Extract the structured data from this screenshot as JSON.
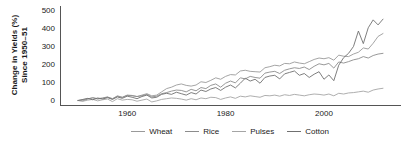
{
  "chart_data": {
    "type": "line",
    "title": "",
    "xlabel": "",
    "ylabel": "Change in Yields (%) Since 1950–51",
    "ylabel_line1": "Change in Yields (%)",
    "ylabel_line2": "Since 1950–51",
    "xlim": [
      1950,
      2012
    ],
    "ylim": [
      -30,
      520
    ],
    "yticks": [
      0,
      100,
      200,
      300,
      400,
      500
    ],
    "ytick_labels": [
      "0",
      "100",
      "200",
      "300",
      "400",
      "500"
    ],
    "xticks": [
      1960,
      1980,
      2000
    ],
    "xtick_labels": [
      "1960",
      "1980",
      "2000"
    ],
    "grid": false,
    "legend_position": "below",
    "axis_color": "#555555",
    "x": [
      1950,
      1951,
      1952,
      1953,
      1954,
      1955,
      1956,
      1957,
      1958,
      1959,
      1960,
      1961,
      1962,
      1963,
      1964,
      1965,
      1966,
      1967,
      1968,
      1969,
      1970,
      1971,
      1972,
      1973,
      1974,
      1975,
      1976,
      1977,
      1978,
      1979,
      1980,
      1981,
      1982,
      1983,
      1984,
      1985,
      1986,
      1987,
      1988,
      1989,
      1990,
      1991,
      1992,
      1993,
      1994,
      1995,
      1996,
      1997,
      1998,
      1999,
      2000,
      2001,
      2002,
      2003,
      2004,
      2005,
      2006,
      2007,
      2008,
      2009,
      2010,
      2011,
      2012
    ],
    "series": [
      {
        "name": "Wheat",
        "color": "#9a9a9a",
        "values": [
          0,
          4,
          10,
          14,
          8,
          12,
          18,
          11,
          22,
          17,
          28,
          26,
          22,
          30,
          38,
          26,
          30,
          48,
          66,
          74,
          86,
          92,
          84,
          80,
          86,
          104,
          100,
          112,
          126,
          118,
          134,
          144,
          142,
          164,
          168,
          162,
          160,
          158,
          182,
          188,
          196,
          192,
          206,
          204,
          214,
          208,
          204,
          216,
          228,
          236,
          232,
          238,
          224,
          252,
          246,
          244,
          258,
          268,
          292,
          286,
          318,
          356,
          372
        ]
      },
      {
        "name": "Rice",
        "color": "#8c8c8c",
        "values": [
          0,
          -2,
          8,
          16,
          10,
          14,
          20,
          8,
          26,
          18,
          30,
          28,
          22,
          26,
          34,
          20,
          24,
          38,
          44,
          52,
          58,
          56,
          48,
          62,
          54,
          72,
          66,
          84,
          92,
          74,
          96,
          108,
          98,
          126,
          120,
          134,
          128,
          124,
          152,
          158,
          162,
          150,
          168,
          176,
          182,
          178,
          186,
          172,
          190,
          204,
          198,
          206,
          180,
          214,
          208,
          216,
          226,
          232,
          244,
          236,
          250,
          258,
          262
        ]
      },
      {
        "name": "Pulses",
        "color": "#a5a5a5",
        "values": [
          0,
          -4,
          2,
          6,
          -2,
          4,
          8,
          -6,
          10,
          2,
          6,
          4,
          -4,
          2,
          8,
          -8,
          -2,
          6,
          10,
          14,
          12,
          8,
          2,
          10,
          4,
          14,
          10,
          18,
          16,
          6,
          14,
          20,
          12,
          24,
          20,
          26,
          22,
          18,
          28,
          26,
          30,
          24,
          32,
          28,
          34,
          30,
          26,
          32,
          36,
          34,
          30,
          36,
          26,
          40,
          36,
          42,
          44,
          48,
          52,
          46,
          58,
          64,
          68
        ]
      },
      {
        "name": "Cotton",
        "color": "#707070",
        "values": [
          0,
          6,
          12,
          4,
          14,
          8,
          16,
          6,
          20,
          12,
          24,
          18,
          10,
          22,
          30,
          14,
          18,
          34,
          40,
          34,
          46,
          38,
          30,
          44,
          36,
          58,
          50,
          64,
          72,
          56,
          74,
          86,
          70,
          96,
          124,
          108,
          118,
          96,
          128,
          136,
          140,
          120,
          148,
          156,
          164,
          140,
          150,
          128,
          146,
          160,
          118,
          142,
          110,
          196,
          238,
          262,
          300,
          386,
          316,
          404,
          448,
          420,
          452
        ]
      }
    ]
  },
  "legend": {
    "items": [
      {
        "label": "Wheat",
        "color": "#9a9a9a"
      },
      {
        "label": "Rice",
        "color": "#8c8c8c"
      },
      {
        "label": "Pulses",
        "color": "#a5a5a5"
      },
      {
        "label": "Cotton",
        "color": "#707070"
      }
    ]
  }
}
